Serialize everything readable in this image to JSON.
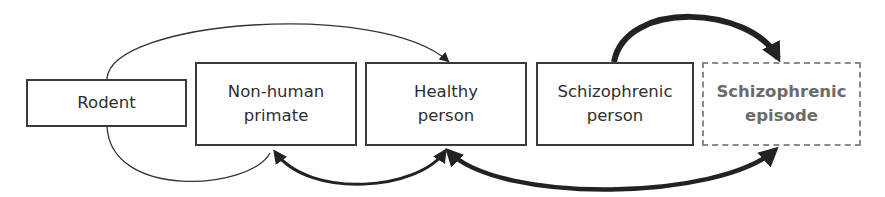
{
  "diagram": {
    "nodes": [
      {
        "id": "rodent",
        "label": "Rodent",
        "style": "solid"
      },
      {
        "id": "non-human-primate",
        "label": "Non-human\nprimate",
        "style": "solid"
      },
      {
        "id": "healthy-person",
        "label": "Healthy\nperson",
        "style": "solid"
      },
      {
        "id": "schizophrenic-person",
        "label": "Schizophrenic\nperson",
        "style": "solid"
      },
      {
        "id": "schizophrenic-episode",
        "label": "Schizophrenic\nepisode",
        "style": "dashed"
      }
    ],
    "edges": [
      {
        "from": "rodent",
        "to": "healthy-person",
        "weight": "thin",
        "side": "top"
      },
      {
        "from": "rodent",
        "to": "non-human-primate",
        "weight": "thin",
        "side": "bottom"
      },
      {
        "from": "non-human-primate",
        "to": "healthy-person",
        "weight": "medium",
        "side": "bottom",
        "bidirectional": true
      },
      {
        "from": "healthy-person",
        "to": "schizophrenic-episode",
        "weight": "thick",
        "side": "bottom",
        "bidirectional": true
      },
      {
        "from": "schizophrenic-person",
        "to": "schizophrenic-episode",
        "weight": "thick",
        "side": "top"
      }
    ],
    "colors": {
      "line": "#222222",
      "box_border": "#3a3a3a",
      "dashed_border": "#8a8a8a",
      "dashed_text": "#6b6b6b"
    }
  }
}
